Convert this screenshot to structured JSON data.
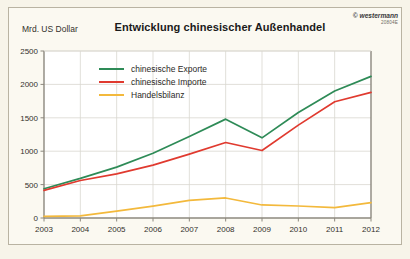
{
  "chart_data": {
    "type": "line",
    "title": "Entwicklung chinesischer Außenhandel",
    "ylabel": "Mrd. US Dollar",
    "xlabel": "",
    "x": [
      2003,
      2004,
      2005,
      2006,
      2007,
      2008,
      2009,
      2010,
      2011,
      2012
    ],
    "xtick_labels": [
      "2003",
      "2004",
      "2005",
      "2006",
      "2007",
      "2008",
      "2009",
      "2010",
      "2011",
      "2012"
    ],
    "ytick_labels": [
      "0",
      "500",
      "1000",
      "1500",
      "2000",
      "2500"
    ],
    "yticks": [
      0,
      500,
      1000,
      1500,
      2000,
      2500
    ],
    "ylim": [
      0,
      2500
    ],
    "xlim": [
      2003,
      2012
    ],
    "grid": true,
    "legend_position": "upper-left-inside",
    "series": [
      {
        "name": "chinesische Exporte",
        "color": "#2e8b57",
        "values": [
          438,
          593,
          762,
          969,
          1220,
          1480,
          1200,
          1580,
          1900,
          2120
        ]
      },
      {
        "name": "chinesische Importe",
        "color": "#e03a2f",
        "values": [
          413,
          561,
          660,
          792,
          956,
          1130,
          1010,
          1390,
          1740,
          1880
        ]
      },
      {
        "name": "Handelsbilanz",
        "color": "#f4b party",
        "values": [
          25,
          32,
          102,
          177,
          264,
          300,
          195,
          180,
          155,
          230
        ]
      }
    ]
  },
  "header": {
    "title": "Entwicklung chinesischer Außenhandel",
    "y_axis_unit": "Mrd. US Dollar"
  },
  "brand": {
    "mark": "© westermann",
    "code": "20804E"
  },
  "colors": {
    "exports": "#2e8b57",
    "imports": "#e03a2f",
    "balance": "#f3b93c",
    "grid": "#d9d7cf",
    "axis": "#8c887e",
    "background": "#fbf9f1",
    "plot_background": "#ffffff"
  }
}
